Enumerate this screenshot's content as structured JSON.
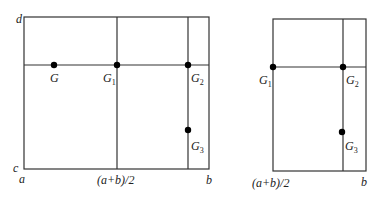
{
  "left_panel": {
    "corner_labels": {
      "top_left": "d",
      "bottom_left_y": "c",
      "bottom_left_x": "a",
      "bottom_right": "b"
    },
    "mid_label": "(a+b)/2",
    "points": [
      {
        "name": "G",
        "base": "G",
        "sub": ""
      },
      {
        "name": "G1",
        "base": "G",
        "sub": "1"
      },
      {
        "name": "G2",
        "base": "G",
        "sub": "2"
      },
      {
        "name": "G3",
        "base": "G",
        "sub": "3"
      }
    ]
  },
  "right_panel": {
    "mid_label": "(a+b)/2",
    "right_label": "b",
    "points": [
      {
        "name": "G1",
        "base": "G",
        "sub": "1"
      },
      {
        "name": "G2",
        "base": "G",
        "sub": "2"
      },
      {
        "name": "G3",
        "base": "G",
        "sub": "3"
      }
    ]
  }
}
